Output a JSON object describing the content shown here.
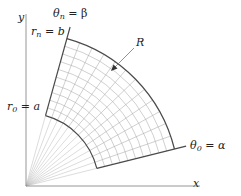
{
  "diagram": {
    "origin": {
      "x": 26,
      "y": 186
    },
    "axes": {
      "x_label": "x",
      "y_label": "y",
      "x_end": 200,
      "y_top": 14
    },
    "region": {
      "label": "R",
      "inner_radius_px": 73,
      "outer_radius_px": 153,
      "theta_start_deg": 14,
      "theta_end_deg": 74.5,
      "radial_divisions": 10,
      "angular_divisions": 12,
      "origin_rays": 13
    },
    "labels": {
      "y_axis": "y",
      "x_axis": "x",
      "theta_n": "θ",
      "theta_n_sub": "n",
      "theta_n_rhs": " = β",
      "r_n": "r",
      "r_n_sub": "n",
      "r_n_rhs": " = b",
      "r_0": "r",
      "r_0_sub": "0",
      "r_0_rhs": " = a",
      "theta_0": "θ",
      "theta_0_sub": "0",
      "theta_0_rhs": " = α",
      "region": "R"
    },
    "colors": {
      "boundary": "#4a4a4a",
      "grid": "#a8a8a8",
      "axis": "#8a8a8a",
      "text": "#222222"
    }
  }
}
